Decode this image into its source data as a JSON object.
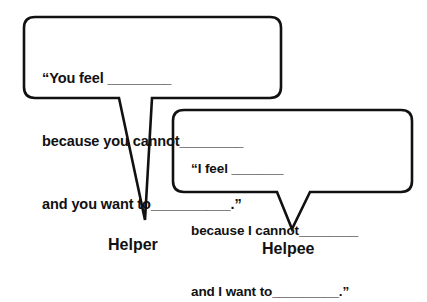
{
  "colors": {
    "stroke": "#111111",
    "fill": "#ffffff",
    "text": "#111111"
  },
  "helper_bubble": {
    "line1": "“You feel ________",
    "line2": "because you cannot________",
    "line3": "and you want to__________.”"
  },
  "helpee_bubble": {
    "line1": "“I feel _______",
    "line2": "because I cannot________",
    "line3": "and I want to_________.”"
  },
  "labels": {
    "helper": "Helper",
    "helpee": "Helpee"
  }
}
